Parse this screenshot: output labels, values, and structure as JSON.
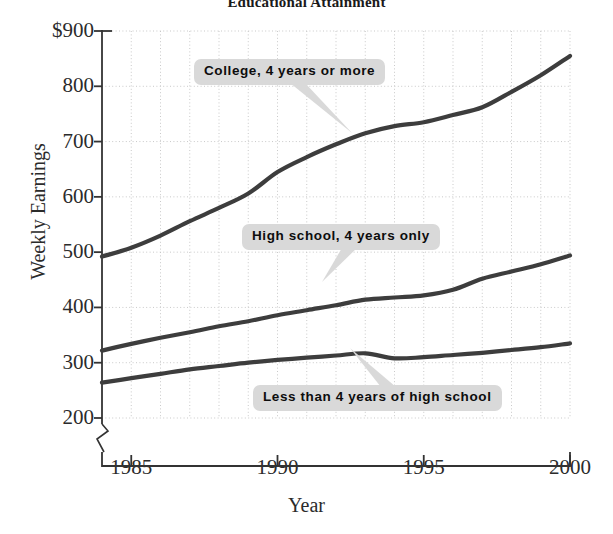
{
  "chart_data": {
    "type": "line",
    "title": "Educational Attainment",
    "xlabel": "Year",
    "ylabel": "Weekly Earnings",
    "xlim": [
      1984,
      2000
    ],
    "ylim": [
      170,
      900
    ],
    "ytick_labels": [
      "$900",
      "800",
      "700",
      "600",
      "500",
      "400",
      "300",
      "200"
    ],
    "ytick_values": [
      900,
      800,
      700,
      600,
      500,
      400,
      300,
      200
    ],
    "xtick_labels": [
      "1985",
      "1990",
      "1995",
      "2000"
    ],
    "xtick_values": [
      1985,
      1990,
      1995,
      2000
    ],
    "grid": "dotted-both-axes",
    "axis_break": true,
    "legend_position": "inline-callouts",
    "line_color": "#3d3d3d",
    "callout_bg": "#d9d9d9",
    "x": [
      1984,
      1985,
      1986,
      1987,
      1988,
      1989,
      1990,
      1991,
      1992,
      1993,
      1994,
      1995,
      1996,
      1997,
      1998,
      1999,
      2000
    ],
    "series": [
      {
        "name": "College, 4 years or more",
        "values": [
          492,
          508,
          530,
          556,
          580,
          606,
          645,
          672,
          695,
          715,
          728,
          735,
          748,
          762,
          790,
          820,
          855
        ]
      },
      {
        "name": "High school, 4 years only",
        "values": [
          322,
          334,
          345,
          355,
          366,
          375,
          386,
          395,
          404,
          414,
          418,
          422,
          432,
          452,
          465,
          478,
          494
        ]
      },
      {
        "name": "Less than 4 years of high school",
        "values": [
          264,
          272,
          280,
          288,
          294,
          300,
          305,
          309,
          313,
          317,
          308,
          310,
          314,
          318,
          323,
          328,
          335
        ]
      }
    ],
    "callouts": [
      {
        "label": "College, 4 years or more",
        "box_x": 194,
        "box_y": 59,
        "tail_x": 352,
        "tail_y": 133
      },
      {
        "label": "High school, 4 years only",
        "box_x": 242,
        "box_y": 224,
        "tail_x": 322,
        "tail_y": 282
      },
      {
        "label": "Less than 4 years of high school",
        "box_x": 253,
        "box_y": 385,
        "tail_x": 350,
        "tail_y": 348
      }
    ]
  }
}
